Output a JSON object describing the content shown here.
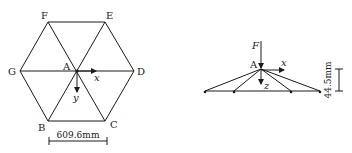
{
  "left_diagram": {
    "title": "hexagonal truss plan view",
    "nodes": {
      "F": "F",
      "E": "E",
      "G": "G",
      "D": "D",
      "A": "A",
      "B": "B",
      "C": "C"
    },
    "axes": {
      "x": "x",
      "y": "y"
    },
    "dimension": "609.6mm"
  },
  "right_diagram": {
    "title": "side elevation",
    "apex": "A",
    "force": "F",
    "axes": {
      "x": "x",
      "z": "z"
    },
    "dimension": "44.5mm"
  },
  "colors": {
    "ink": "#1a1a1a",
    "background": "#ffffff"
  }
}
